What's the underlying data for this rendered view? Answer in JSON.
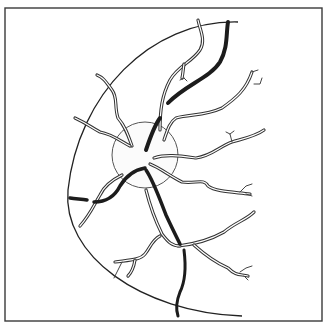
{
  "figure": {
    "colors": {
      "ink": "#222222",
      "paper": "#ffffff",
      "vein_fill": "#1c1c1c"
    },
    "frame": {
      "x": 5,
      "y": 8,
      "width": 317,
      "height": 313
    },
    "optic_disc": {
      "cx": 145,
      "cy": 155,
      "r": 33
    },
    "fundus_edge_path": "M238 22 C 150 20, 78 95, 68 190 C 62 255, 140 312, 242 316",
    "thin_vessels": [
      {
        "name": "superior-nasal-branch",
        "d": "M160 130 C 160 110, 162 95, 170 80 C 178 66, 192 62, 200 50 C 206 40, 200 30, 198 20"
      },
      {
        "name": "superior-twig",
        "d": "M184 64 C 183 70, 183 74, 182 78"
      },
      {
        "name": "upper-left-vessel",
        "d": "M132 146 C 128 135, 125 126, 118 118 C 114 106, 118 98, 112 90 C 106 82, 104 78, 97 75"
      },
      {
        "name": "left-vessel",
        "d": "M130 146 C 122 142, 112 134, 100 132 C 92 128, 88 124, 75 118"
      },
      {
        "name": "upper-right-vessel-1",
        "d": "M164 140 C 168 128, 170 122, 176 118 C 190 114, 205 116, 222 108 C 236 98, 246 90, 252 72"
      },
      {
        "name": "upper-right-vessel-2",
        "d": "M154 158 C 166 154, 180 156, 196 158 C 212 156, 220 146, 232 142 C 246 138, 256 136, 264 130"
      },
      {
        "name": "right-vessel-mid",
        "d": "M150 164 C 160 168, 170 176, 182 182 C 196 184, 204 178, 208 186 C 216 192, 234 192, 250 194"
      },
      {
        "name": "lower-right-vessel",
        "d": "M178 246 C 196 244, 210 240, 224 232 C 236 222, 246 220, 254 212"
      },
      {
        "name": "lower-right-branch",
        "d": "M194 245 C 204 254, 214 262, 228 268 C 236 276, 240 274, 248 276"
      },
      {
        "name": "lower-descending-thin",
        "d": "M146 190 C 150 206, 156 222, 162 234 C 168 242, 172 246, 180 246"
      },
      {
        "name": "lower-left-vessel",
        "d": "M160 236 C 152 240, 150 248, 145 254 C 140 260, 130 260, 115 262"
      },
      {
        "name": "lower-left-twig",
        "d": "M135 260 C 134 266, 132 272, 128 276"
      },
      {
        "name": "left-lower-vessel",
        "d": "M122 175 C 112 180, 104 186, 100 195 C 94 205, 90 215, 80 226"
      }
    ],
    "thick_veins": [
      {
        "name": "superior-vein",
        "d": "M168 103 C 185 85, 210 78, 220 62 C 228 48, 226 34, 228 22",
        "width": 4
      },
      {
        "name": "disc-vein-upper",
        "d": "M160 118 C 154 126, 150 138, 146 150",
        "width": 4
      },
      {
        "name": "inferior-vein",
        "d": "M146 170 C 154 182, 160 200, 166 215 C 172 228, 176 236, 180 244",
        "width": 3.5
      },
      {
        "name": "inferior-vein-lower",
        "d": "M184 250 C 186 266, 186 280, 180 292 C 176 302, 176 310, 178 316",
        "width": 3
      },
      {
        "name": "left-vein",
        "d": "M145 168 C 134 170, 126 176, 120 186 C 114 198, 104 202, 94 202",
        "width": 3.5
      },
      {
        "name": "left-vein-edge",
        "d": "M70 198 C 76 199, 82 199, 87 200",
        "width": 3.5
      }
    ],
    "twigs": [
      "M184 78 L180 80 M184 78 L187 81",
      "M252 72 L258 70 M254 84 L260 84 L262 78",
      "M232 142 L230 134 L226 132 M230 134 L234 131",
      "M240 192 L246 186 L252 184 M246 194 L252 196",
      "M240 272 L246 268 L252 266 M244 276 L248 280",
      "M122 262 L118 270 L114 278"
    ]
  }
}
